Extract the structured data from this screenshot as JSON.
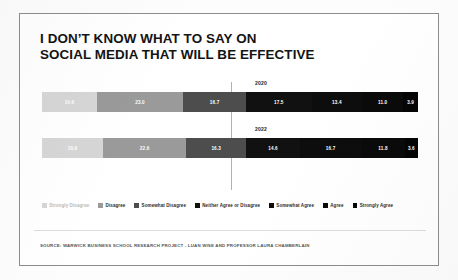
{
  "title": "I DON’T KNOW WHAT TO SAY ON\nSOCIAL MEDIA THAT WILL BE EFFECTIVE",
  "source": "SOURCE: WARWICK BUSINESS SCHOOL RESEARCH PROJECT - LUAN WISE AND PROFESSOR LAURA CHAMBERLAIN",
  "legend": [
    {
      "label": "Strongly Disagree",
      "color": "#d6d6d6",
      "dim": true
    },
    {
      "label": "Disagree",
      "color": "#9a9a9a",
      "dim": false
    },
    {
      "label": "Somewhat Disagree",
      "color": "#4d4d4d",
      "dim": false
    },
    {
      "label": "Neither Agree or Disagree",
      "color": "#111111",
      "dim": false
    },
    {
      "label": "Somewhat Agree",
      "color": "#0d0d0d",
      "dim": false
    },
    {
      "label": "Agree",
      "color": "#0a0a0a",
      "dim": false
    },
    {
      "label": "Strongly Agree",
      "color": "#050505",
      "dim": false
    }
  ],
  "chart_data": {
    "type": "bar",
    "orientation": "horizontal",
    "stacked": true,
    "normalized_percent": true,
    "title": "I DON’T KNOW WHAT TO SAY ON SOCIAL MEDIA THAT WILL BE EFFECTIVE",
    "xlabel": "",
    "ylabel": "",
    "xlim": [
      0,
      100
    ],
    "grid": false,
    "legend_position": "bottom",
    "categories": [
      "2020",
      "2022"
    ],
    "series": [
      {
        "name": "Strongly Disagree",
        "color": "#d6d6d6",
        "text_color": "#ffffff",
        "values": [
          14.6,
          16.6
        ]
      },
      {
        "name": "Disagree",
        "color": "#9a9a9a",
        "text_color": "#ffffff",
        "values": [
          23.0,
          22.6
        ]
      },
      {
        "name": "Somewhat Disagree",
        "color": "#4d4d4d",
        "text_color": "#ffffff",
        "values": [
          16.7,
          16.3
        ]
      },
      {
        "name": "Neither Agree or Disagree",
        "color": "#111111",
        "text_color": "#ffffff",
        "values": [
          17.5,
          14.6
        ]
      },
      {
        "name": "Somewhat Agree",
        "color": "#0d0d0d",
        "text_color": "#ffffff",
        "values": [
          13.4,
          16.7
        ]
      },
      {
        "name": "Agree",
        "color": "#0a0a0a",
        "text_color": "#ffffff",
        "values": [
          11.0,
          11.8
        ]
      },
      {
        "name": "Strongly Agree",
        "color": "#050505",
        "text_color": "#ffffff",
        "values": [
          3.9,
          3.6
        ]
      }
    ],
    "bars": [
      {
        "year": "2020",
        "segments": [
          {
            "label": "Strongly Disagree",
            "value": 14.6,
            "display": "14.6",
            "color": "#d6d6d6",
            "text_color": "#ffffff"
          },
          {
            "label": "Disagree",
            "value": 23.0,
            "display": "23.0",
            "color": "#9a9a9a",
            "text_color": "#ffffff"
          },
          {
            "label": "Somewhat Disagree",
            "value": 16.7,
            "display": "16.7",
            "color": "#4d4d4d",
            "text_color": "#ffffff"
          },
          {
            "label": "Neither Agree or Disagree",
            "value": 17.5,
            "display": "17.5",
            "color": "#111111",
            "text_color": "#ffffff"
          },
          {
            "label": "Somewhat Agree",
            "value": 13.4,
            "display": "13.4",
            "color": "#0d0d0d",
            "text_color": "#ffffff"
          },
          {
            "label": "Agree",
            "value": 11.0,
            "display": "11.0",
            "color": "#0a0a0a",
            "text_color": "#ffffff"
          },
          {
            "label": "Strongly Agree",
            "value": 3.9,
            "display": "3.9",
            "color": "#050505",
            "text_color": "#ffffff"
          }
        ]
      },
      {
        "year": "2022",
        "segments": [
          {
            "label": "Strongly Disagree",
            "value": 16.6,
            "display": "16.6",
            "color": "#d6d6d6",
            "text_color": "#ffffff"
          },
          {
            "label": "Disagree",
            "value": 22.6,
            "display": "22.6",
            "color": "#9a9a9a",
            "text_color": "#ffffff"
          },
          {
            "label": "Somewhat Disagree",
            "value": 16.3,
            "display": "16.3",
            "color": "#4d4d4d",
            "text_color": "#ffffff"
          },
          {
            "label": "Neither Agree or Disagree",
            "value": 14.6,
            "display": "14.6",
            "color": "#111111",
            "text_color": "#ffffff"
          },
          {
            "label": "Somewhat Agree",
            "value": 16.7,
            "display": "16.7",
            "color": "#0d0d0d",
            "text_color": "#ffffff"
          },
          {
            "label": "Agree",
            "value": 11.8,
            "display": "11.8",
            "color": "#0a0a0a",
            "text_color": "#ffffff"
          },
          {
            "label": "Strongly Agree",
            "value": 3.6,
            "display": "3.6",
            "color": "#050505",
            "text_color": "#ffffff"
          }
        ]
      }
    ]
  }
}
